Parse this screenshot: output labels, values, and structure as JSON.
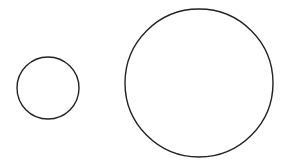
{
  "canvas": {
    "width": 289,
    "height": 163,
    "background": "#ffffff"
  },
  "stroke": {
    "color": "#222222",
    "width": 1.4
  },
  "shapes": [
    {
      "name": "small-circle",
      "cx": 48,
      "cy": 88,
      "r": 31
    },
    {
      "name": "large-circle",
      "cx": 199,
      "cy": 83,
      "r": 74
    }
  ]
}
